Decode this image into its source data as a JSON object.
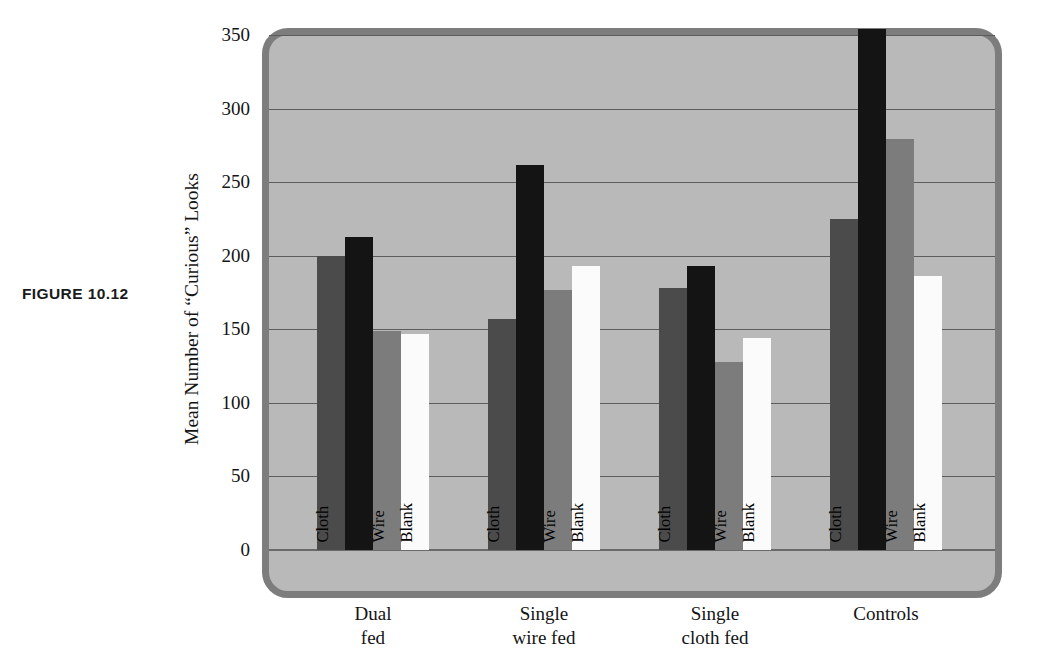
{
  "figure": {
    "caption": "FIGURE  10.12"
  },
  "chart_data": {
    "type": "bar",
    "title": "",
    "xlabel": "",
    "ylabel": "Mean Number of “Curious” Looks",
    "ylim": [
      0,
      350
    ],
    "ytick_values": [
      0,
      50,
      100,
      150,
      200,
      250,
      300,
      350
    ],
    "ytick_labels": [
      "0",
      "50",
      "100",
      "150",
      "200",
      "250",
      "300",
      "350"
    ],
    "grid": true,
    "legend_position": "none",
    "categories": [
      "Dual\nfed",
      "Single\nwire fed",
      "Single\ncloth fed",
      "Controls"
    ],
    "bar_labels": [
      "Cloth",
      "",
      "Wire",
      "Blank"
    ],
    "bar_colors": [
      "#4b4b4b",
      "#141414",
      "#7c7c7c",
      "#fbfbfb"
    ],
    "series": [
      {
        "name": "Cloth",
        "values": [
          200,
          157,
          178,
          225
        ]
      },
      {
        "name": "",
        "values": [
          213,
          262,
          193,
          354
        ]
      },
      {
        "name": "Wire",
        "values": [
          149,
          177,
          128,
          279
        ]
      },
      {
        "name": "Blank",
        "values": [
          147,
          193,
          144,
          186
        ]
      }
    ],
    "background_color": "#b9b9b9",
    "border_color": "#7d7d7d",
    "gridline_color": "#5d5d5d"
  }
}
